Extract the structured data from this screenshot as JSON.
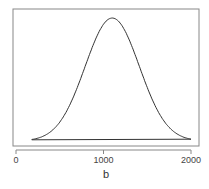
{
  "chart_data": {
    "type": "line",
    "title": "",
    "xlabel": "b",
    "ylabel": "",
    "xlim": [
      0,
      2000
    ],
    "x_ticks": [
      0,
      1000,
      2000
    ],
    "x_tick_labels": [
      "0",
      "1000",
      "2000"
    ],
    "y_ticks": [],
    "grid": false,
    "legend": null,
    "series": [
      {
        "name": "density",
        "description": "Bell-shaped density curve with a closing baseline, peaking near b≈1100, spanning b≈180 to 2000",
        "x": [
          180,
          300,
          400,
          500,
          600,
          700,
          800,
          900,
          1000,
          1100,
          1200,
          1300,
          1400,
          1500,
          1600,
          1700,
          1800,
          1900,
          2000
        ],
        "y": [
          0.01,
          0.04,
          0.09,
          0.17,
          0.29,
          0.45,
          0.63,
          0.81,
          0.95,
          1.0,
          0.95,
          0.81,
          0.63,
          0.45,
          0.29,
          0.17,
          0.09,
          0.04,
          0.01
        ]
      }
    ]
  }
}
